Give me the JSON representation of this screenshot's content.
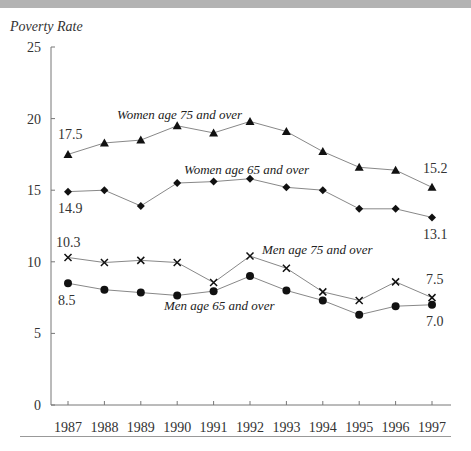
{
  "chart_data": {
    "type": "line",
    "title": "",
    "ylabel": "Poverty Rate",
    "xlabel": "",
    "ylim": [
      0,
      25
    ],
    "yticks": [
      0,
      5,
      10,
      15,
      20,
      25
    ],
    "grid": false,
    "legend_position": "inline labels",
    "x": [
      1987,
      1988,
      1989,
      1990,
      1991,
      1992,
      1993,
      1994,
      1995,
      1996,
      1997
    ],
    "series": [
      {
        "name": "Women age 75 and over",
        "marker": "triangle",
        "values": [
          17.5,
          18.3,
          18.5,
          19.5,
          19.0,
          19.8,
          19.1,
          17.7,
          16.6,
          16.4,
          15.2
        ]
      },
      {
        "name": "Women age 65 and over",
        "marker": "diamond",
        "values": [
          14.9,
          15.0,
          13.9,
          15.5,
          15.6,
          15.8,
          15.2,
          15.0,
          13.7,
          13.7,
          13.1
        ]
      },
      {
        "name": "Men age 75 and over",
        "marker": "cross",
        "values": [
          10.3,
          9.95,
          10.1,
          9.95,
          8.55,
          10.4,
          9.55,
          7.9,
          7.3,
          8.6,
          7.5
        ]
      },
      {
        "name": "Men age 65 and over",
        "marker": "circle",
        "values": [
          8.5,
          8.05,
          7.85,
          7.65,
          7.95,
          9.0,
          8.0,
          7.3,
          6.3,
          6.9,
          7.0
        ]
      }
    ],
    "annotations": [
      {
        "text": "17.5",
        "series": "Women age 75 and over",
        "x": 1987
      },
      {
        "text": "15.2",
        "series": "Women age 75 and over",
        "x": 1997
      },
      {
        "text": "14.9",
        "series": "Women age 65 and over",
        "x": 1987
      },
      {
        "text": "13.1",
        "series": "Women age 65 and over",
        "x": 1997
      },
      {
        "text": "10.3",
        "series": "Men age 75 and over",
        "x": 1987
      },
      {
        "text": "7.5",
        "series": "Men age 75 and over",
        "x": 1997
      },
      {
        "text": "8.5",
        "series": "Men age 65 and over",
        "x": 1987
      },
      {
        "text": "7.0",
        "series": "Men age 65 and over",
        "x": 1997
      }
    ]
  },
  "labels": {
    "y_axis_title": "Poverty Rate",
    "women75": "Women age 75 and over",
    "women65": "Women age 65 and over",
    "men75": "Men age 75 and over",
    "men65": "Men age 65 and over",
    "w75_start": "17.5",
    "w75_end": "15.2",
    "w65_start": "14.9",
    "w65_end": "13.1",
    "m75_start": "10.3",
    "m75_end": "7.5",
    "m65_start": "8.5",
    "m65_end": "7.0"
  },
  "colors": {
    "line": "#888888",
    "marker": "#111111",
    "axis": "#777777",
    "topbar": "#b3b3b3"
  }
}
